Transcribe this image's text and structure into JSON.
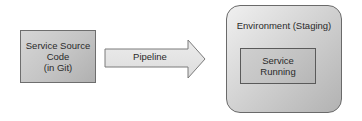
{
  "diagram": {
    "source": {
      "lines": [
        "Service Source",
        "Code",
        "(in Git)"
      ]
    },
    "pipeline": {
      "label": "Pipeline"
    },
    "environment": {
      "title": "Environment (Staging)",
      "inner": {
        "lines": [
          "Service",
          "Running"
        ]
      }
    },
    "colors": {
      "box_fill": "#c4c4c4",
      "box_border": "#6e6e6e",
      "arrow_fill": "#e6e6e6",
      "arrow_border": "#7a7a7a",
      "text": "#2a2a2a"
    }
  }
}
